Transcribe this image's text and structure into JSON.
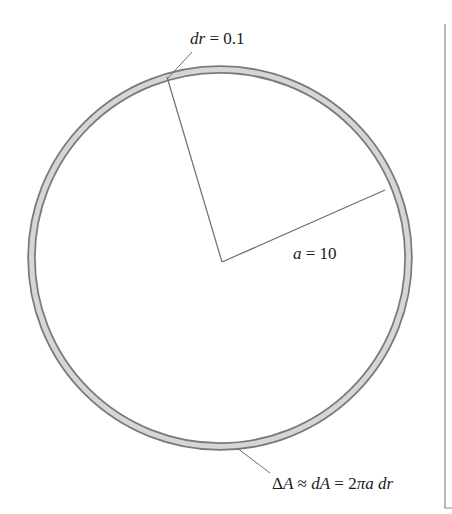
{
  "diagram": {
    "type": "annular-ring-area",
    "labels": {
      "dr": {
        "var": "dr",
        "eq": " = ",
        "val": "0.1"
      },
      "radius": {
        "var": "a",
        "eq": " = ",
        "val": "10"
      },
      "area": {
        "delta": "Δ",
        "A1": "A",
        "approx": " ≈ ",
        "dA": "dA",
        "eq": " = ",
        "two": "2",
        "pi": "π",
        "a": "a",
        "space": " ",
        "dr": "dr"
      }
    },
    "colors": {
      "ring_fill": "#d6d6d6",
      "ring_stroke": "#7a7a7a",
      "line": "#6e6e6e",
      "text": "#1a1a1a"
    },
    "geometry": {
      "center": [
        220,
        258
      ],
      "outer_radius": 192,
      "inner_radius": 185
    }
  }
}
